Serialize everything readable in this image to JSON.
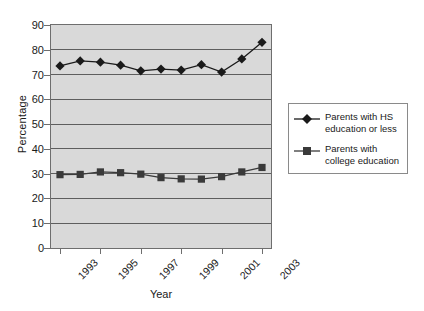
{
  "chart_data": {
    "type": "line",
    "title": "",
    "xlabel": "Year",
    "ylabel": "Percentage",
    "ylim": [
      0,
      90
    ],
    "ytick_step": 10,
    "yticks": [
      90,
      80,
      70,
      60,
      50,
      40,
      30,
      20,
      10,
      0
    ],
    "grid": true,
    "grid_axis": "y",
    "legend_position": "right",
    "x": [
      1993,
      1994,
      1995,
      1996,
      1997,
      1998,
      1999,
      2000,
      2001,
      2002,
      2003
    ],
    "categories": [
      "1993",
      "1994",
      "1995",
      "1996",
      "1997",
      "1998",
      "1999",
      "2000",
      "2001",
      "2002",
      "2003"
    ],
    "xtick_labels": [
      "1993",
      "1995",
      "1997",
      "1999",
      "2001",
      "2003"
    ],
    "xtick_values": [
      1993,
      1995,
      1997,
      1999,
      2001,
      2003
    ],
    "series": [
      {
        "name": "Parents with HS education or less",
        "marker": "diamond",
        "color": "#1a1a1a",
        "values": [
          73.5,
          75.5,
          75.0,
          73.8,
          71.5,
          72.2,
          71.8,
          74.0,
          71.0,
          76.3,
          83.0
        ]
      },
      {
        "name": "Parents with college education",
        "marker": "square",
        "color": "#3a3a3a",
        "values": [
          29.6,
          29.7,
          30.7,
          30.4,
          29.8,
          28.4,
          27.9,
          27.8,
          28.8,
          30.7,
          32.5
        ]
      }
    ]
  },
  "axes": {
    "y_title": "Percentage",
    "x_title": "Year"
  },
  "legend": {
    "items": [
      {
        "label": "Parents with HS\neducation or less",
        "marker": "diamond"
      },
      {
        "label": "Parents with\ncollege education",
        "marker": "square"
      }
    ]
  },
  "colors": {
    "plot_background": "#d9d9d9",
    "gridline": "#5e5e5e",
    "axis": "#6e6e6e",
    "series_primary": "#1a1a1a",
    "series_secondary": "#3a3a3a",
    "legend_border": "#8a8a8a"
  }
}
